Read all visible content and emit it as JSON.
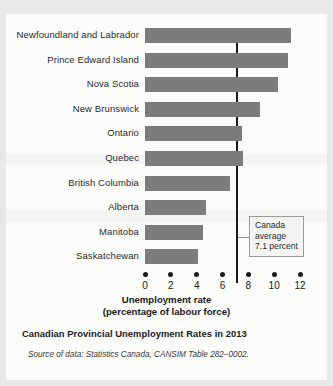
{
  "page": {
    "bleed_text": "· ·  ·        ·  ·                        ·      ·"
  },
  "figure": {
    "caption": "Canadian Provincial Unemployment Rates in 2013",
    "source": "Source of data: Statistics Canada, CANSIM Table 282–0002.",
    "axis_title_line1": "Unemployment rate",
    "axis_title_line2": "(percentage of labour force)",
    "callout": {
      "line1": "Canada",
      "line2": "average",
      "line3": "7.1 percent"
    },
    "colors": {
      "bar": "#7c7c7c",
      "reference_line": "#1a1a1a",
      "panel": "#fbfbfa",
      "page": "#e8e8e6"
    }
  },
  "chart_data": {
    "type": "bar",
    "orientation": "horizontal",
    "title": "Canadian Provincial Unemployment Rates in 2013",
    "xlabel": "Unemployment rate (percentage of labour force)",
    "ylabel": "",
    "xlim": [
      0,
      12
    ],
    "xticks": [
      0,
      2,
      4,
      6,
      8,
      10,
      12
    ],
    "xtick_labels": [
      "0",
      "2",
      "4",
      "6",
      "8",
      "10",
      "12"
    ],
    "grid": false,
    "legend": false,
    "categories": [
      "Newfoundland and Labrador",
      "Prince Edward Island",
      "Nova Scotia",
      "New Brunswick",
      "Ontario",
      "Quebec",
      "British Columbia",
      "Alberta",
      "Manitoba",
      "Saskatchewan"
    ],
    "values": [
      11.3,
      11.1,
      10.3,
      8.9,
      7.5,
      7.6,
      6.6,
      4.7,
      4.5,
      4.1
    ],
    "reference_line": {
      "label": "Canada average 7.1 percent",
      "value": 7.1
    },
    "annotations": [
      {
        "text": "Canada average 7.1 percent",
        "points_to": 7.1
      }
    ]
  }
}
